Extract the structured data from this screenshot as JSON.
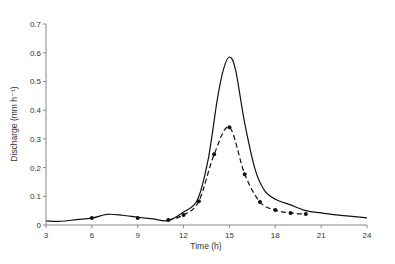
{
  "chart_data": {
    "type": "line",
    "title": "",
    "xlabel": "Time (h)",
    "ylabel": "Discharge (mm h⁻¹)",
    "xlim": [
      3,
      24
    ],
    "ylim": [
      0,
      0.7
    ],
    "xticks": [
      3,
      6,
      9,
      12,
      15,
      18,
      21,
      24
    ],
    "yticks": [
      0,
      0.1,
      0.2,
      0.3,
      0.4,
      0.5,
      0.6,
      0.7
    ],
    "xtick_labels": [
      "3",
      "6",
      "9",
      "12",
      "15",
      "18",
      "21",
      "24"
    ],
    "ytick_labels": [
      "0",
      "0.1",
      "0.2",
      "0.3",
      "0.4",
      "0.5",
      "0.6",
      "0.7"
    ],
    "grid": false,
    "legend": null,
    "series": [
      {
        "name": "Discharge (solid)",
        "style": "solid",
        "x": [
          3,
          4,
          5,
          6,
          7,
          8,
          9,
          10,
          11,
          12,
          12.9,
          13.6,
          14.2,
          14.6,
          15,
          15.4,
          16,
          16.7,
          17.3,
          18,
          19,
          20,
          21,
          22,
          23,
          24
        ],
        "values": [
          0.014,
          0.013,
          0.019,
          0.024,
          0.037,
          0.034,
          0.027,
          0.021,
          0.015,
          0.045,
          0.087,
          0.226,
          0.435,
          0.54,
          0.585,
          0.54,
          0.355,
          0.19,
          0.12,
          0.09,
          0.07,
          0.05,
          0.042,
          0.035,
          0.03,
          0.025
        ]
      },
      {
        "name": "Discharge (dashed, markers)",
        "style": "dashed",
        "marker": "circle",
        "x": [
          11,
          12,
          13,
          14,
          15,
          16,
          17,
          18,
          19,
          20
        ],
        "values": [
          0.017,
          0.035,
          0.083,
          0.246,
          0.34,
          0.177,
          0.08,
          0.052,
          0.042,
          0.038
        ]
      },
      {
        "name": "Isolated points",
        "style": "markers",
        "marker": "circle",
        "x": [
          6,
          9
        ],
        "values": [
          0.024,
          0.024
        ]
      }
    ]
  }
}
